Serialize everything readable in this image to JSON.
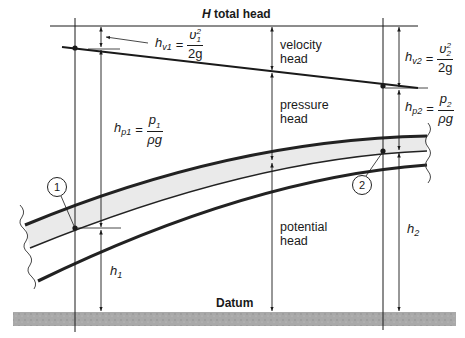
{
  "title": {
    "symbol": "H",
    "text": " total head"
  },
  "labels": {
    "velocity_head": [
      "velocity",
      "head"
    ],
    "pressure_head": [
      "pressure",
      "head"
    ],
    "potential_head": [
      "potential",
      "head"
    ],
    "datum": "Datum"
  },
  "equations": {
    "hv1": {
      "symbol": "h",
      "sub": "v1",
      "num": "υ",
      "num_sup": "2",
      "num_sub": "1",
      "den": "2g"
    },
    "hv2": {
      "symbol": "h",
      "sub": "v2",
      "num": "υ",
      "num_sup": "2",
      "num_sub": "2",
      "den": "2g"
    },
    "hp1": {
      "symbol": "h",
      "sub": "p1",
      "num": "p",
      "num_sub": "1",
      "den": "ρg"
    },
    "hp2": {
      "symbol": "h",
      "sub": "p2",
      "num": "p",
      "num_sub": "2",
      "den": "ρg"
    },
    "equals": "="
  },
  "elevations": {
    "h1": {
      "symbol": "h",
      "sub": "1"
    },
    "h2": {
      "symbol": "h",
      "sub": "2"
    }
  },
  "points": [
    {
      "id": "1",
      "label": "1"
    },
    {
      "id": "2",
      "label": "2"
    }
  ],
  "colors": {
    "line": "#1a1a1a",
    "pipe_wall": "#2a2a2a",
    "pipe_fill": "#e6e6e6",
    "datum_fill": "#a8a8a8"
  }
}
